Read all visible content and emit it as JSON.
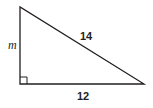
{
  "diagram": {
    "type": "right-triangle",
    "stroke_color": "#231f20",
    "background": "#ffffff",
    "vertices": {
      "top_left": [
        20,
        7
      ],
      "bottom_left": [
        20,
        84
      ],
      "bottom_right": [
        144,
        84
      ]
    },
    "right_angle_marker": {
      "corner": "bottom_left",
      "size": 7
    },
    "labels": {
      "vertical_leg": "m",
      "hypotenuse": "14",
      "horizontal_leg": "12"
    }
  }
}
